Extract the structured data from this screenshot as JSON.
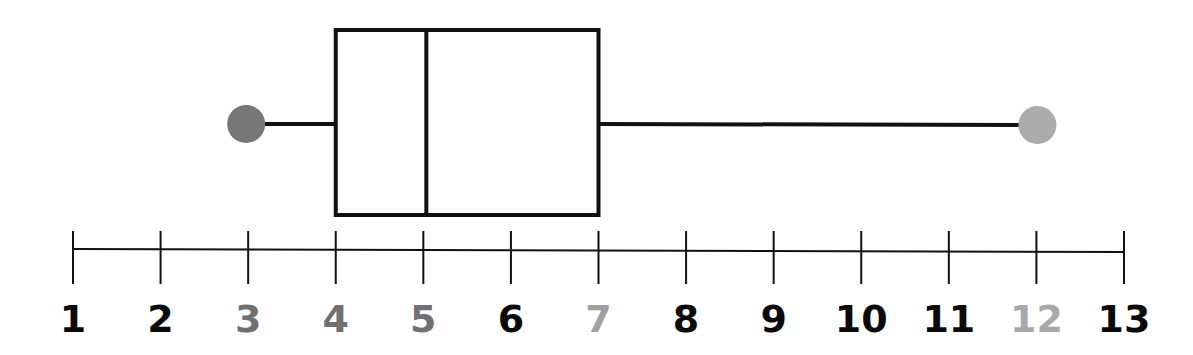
{
  "chart_data": {
    "type": "boxplot",
    "title": "",
    "xlabel": "",
    "ylabel": "",
    "orientation": "horizontal",
    "axis": {
      "min": 1,
      "max": 13,
      "ticks": [
        1,
        2,
        3,
        4,
        5,
        6,
        7,
        8,
        9,
        10,
        11,
        12,
        13
      ],
      "tick_labels": [
        "1",
        "2",
        "3",
        "4",
        "5",
        "6",
        "7",
        "8",
        "9",
        "10",
        "11",
        "12",
        "13"
      ]
    },
    "five_number_summary": {
      "min": 3,
      "q1": 4,
      "median": 5,
      "q3": 7,
      "max": 12
    },
    "highlighted_labels": {
      "3": "#707070",
      "4": "#707070",
      "5": "#707070",
      "7": "#a0a0a0",
      "12": "#a8a8a8"
    },
    "colors": {
      "box_stroke": "#111111",
      "axis": "#111111",
      "label_default": "#0a0a0a",
      "min_point": "#777777",
      "max_point": "#ababab"
    }
  }
}
